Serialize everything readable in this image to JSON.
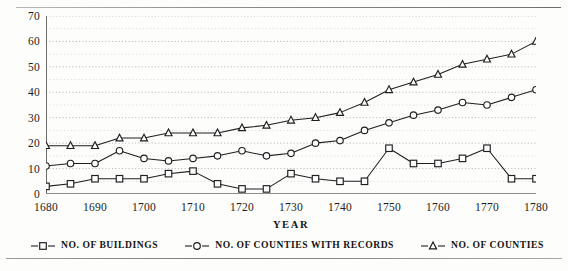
{
  "figure": {
    "rule_top": "horizontal-rule",
    "rule_bottom": "horizontal-rule"
  },
  "chart_data": {
    "type": "line",
    "title": "",
    "xlabel": "YEAR",
    "ylabel": "",
    "xlim": [
      1680,
      1780
    ],
    "ylim": [
      0,
      70
    ],
    "grid": true,
    "grid_style": "dotted-horizontal",
    "legend_position": "bottom",
    "x_major_step": 10,
    "x_minor_step": 5,
    "y_major_step": 10,
    "y_minor_step": 5,
    "x": [
      1680,
      1685,
      1690,
      1695,
      1700,
      1705,
      1710,
      1715,
      1720,
      1725,
      1730,
      1735,
      1740,
      1745,
      1750,
      1755,
      1760,
      1765,
      1770,
      1775,
      1780
    ],
    "xticklabels": [
      "1680",
      "1690",
      "1700",
      "1710",
      "1720",
      "1730",
      "1740",
      "1750",
      "1760",
      "1770",
      "1780"
    ],
    "yticklabels": [
      "0",
      "10",
      "20",
      "30",
      "40",
      "50",
      "60",
      "70"
    ],
    "series": [
      {
        "name": "NO. OF BUILDINGS",
        "marker": "square",
        "values": [
          3,
          4,
          6,
          6,
          6,
          8,
          9,
          4,
          2,
          2,
          8,
          6,
          5,
          5,
          18,
          12,
          12,
          14,
          18,
          6,
          6
        ]
      },
      {
        "name": "NO. OF COUNTIES WITH RECORDS",
        "marker": "circle",
        "values": [
          11,
          12,
          12,
          17,
          14,
          13,
          14,
          15,
          17,
          15,
          16,
          20,
          21,
          25,
          28,
          31,
          33,
          36,
          35,
          38,
          41
        ]
      },
      {
        "name": "NO. OF COUNTIES",
        "marker": "triangle",
        "values": [
          19,
          19,
          19,
          22,
          22,
          24,
          24,
          24,
          26,
          27,
          29,
          30,
          32,
          36,
          41,
          44,
          47,
          51,
          53,
          55,
          60
        ]
      }
    ]
  }
}
